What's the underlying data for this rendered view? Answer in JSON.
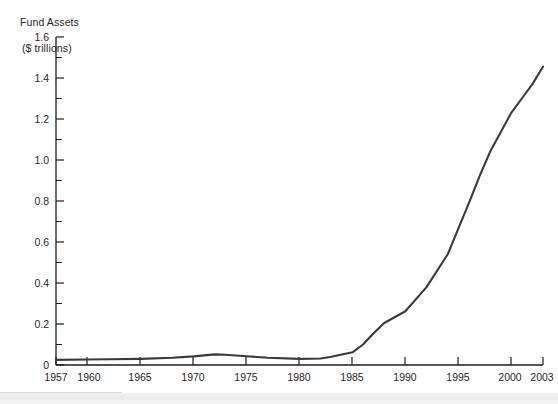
{
  "figure": {
    "axis_title_line1": "Fund Assets",
    "axis_title_line2": "($ trillions)",
    "line_color": "#3a3a3a",
    "axis_color": "#1d1d1d",
    "background": "#ffffff"
  },
  "chart_data": {
    "type": "line",
    "title": "Fund Assets ($ trillions)",
    "xlabel": "",
    "ylabel": "Fund Assets ($ trillions)",
    "xlim": [
      1957,
      2003
    ],
    "ylim": [
      0,
      1.6
    ],
    "grid": false,
    "legend": "none",
    "y_ticks": [
      0,
      0.2,
      0.4,
      0.6,
      0.8,
      1.0,
      1.2,
      1.4,
      1.6
    ],
    "y_tick_labels": [
      "0",
      "0.2",
      "0.4",
      "0.6",
      "0.8",
      "1.0",
      "1.2",
      "1.4",
      "1.6"
    ],
    "y_minor_tick_step": 0.1,
    "x_ticks": [
      1957,
      1960,
      1965,
      1970,
      1975,
      1980,
      1985,
      1990,
      1995,
      2000,
      2003
    ],
    "x_tick_labels": [
      "1957",
      "1960",
      "1965",
      "1970",
      "1975",
      "1980",
      "1985",
      "1990",
      "1995",
      "2000",
      "2003"
    ],
    "series": [
      {
        "name": "Fund Assets",
        "color": "#3a3a3a",
        "x": [
          1957,
          1960,
          1962,
          1965,
          1968,
          1970,
          1972,
          1973,
          1975,
          1977,
          1980,
          1982,
          1983,
          1985,
          1986,
          1987,
          1988,
          1990,
          1992,
          1994,
          1995,
          1996,
          1997,
          1998,
          2000,
          2001,
          2002,
          2003
        ],
        "values": [
          0.025,
          0.027,
          0.028,
          0.03,
          0.035,
          0.042,
          0.052,
          0.05,
          0.043,
          0.035,
          0.03,
          0.032,
          0.04,
          0.062,
          0.1,
          0.155,
          0.205,
          0.262,
          0.38,
          0.54,
          0.665,
          0.79,
          0.92,
          1.04,
          1.23,
          1.3,
          1.37,
          1.455
        ]
      }
    ]
  },
  "icons": {
    "chart_line": "line-chart-icon"
  }
}
